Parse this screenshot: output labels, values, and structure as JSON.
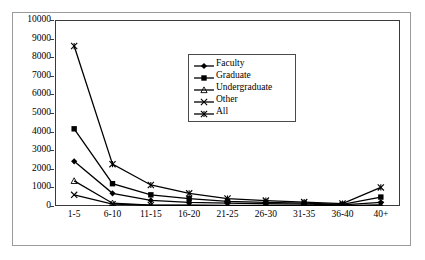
{
  "chart_data": {
    "type": "line",
    "title": "",
    "subtitle": "",
    "xlabel": "",
    "ylabel": "",
    "categories": [
      "1-5",
      "6-10",
      "11-15",
      "16-20",
      "21-25",
      "26-30",
      "31-35",
      "36-40",
      "40+"
    ],
    "ylim": [
      0,
      10000
    ],
    "yticks": [
      0,
      1000,
      2000,
      3000,
      4000,
      5000,
      6000,
      7000,
      8000,
      9000,
      10000
    ],
    "ytick_labels": [
      "0",
      "1000",
      "2000",
      "3000",
      "4000",
      "5000",
      "6000",
      "7000",
      "8000",
      "9000",
      "10000"
    ],
    "grid": false,
    "legend_position": "upper-center-right",
    "series": [
      {
        "name": "Faculty",
        "marker": "diamond",
        "color": "#000000",
        "values": [
          2400,
          680,
          300,
          200,
          150,
          120,
          100,
          60,
          200
        ]
      },
      {
        "name": "Graduate",
        "marker": "square",
        "color": "#000000",
        "values": [
          4150,
          1200,
          600,
          400,
          250,
          200,
          150,
          90,
          480
        ]
      },
      {
        "name": "Undergraduate",
        "marker": "triangle",
        "color": "#000000",
        "values": [
          1350,
          150,
          40,
          30,
          20,
          15,
          10,
          10,
          30
        ]
      },
      {
        "name": "Other",
        "marker": "cross",
        "color": "#000000",
        "values": [
          600,
          100,
          50,
          40,
          30,
          25,
          20,
          15,
          60
        ]
      },
      {
        "name": "All",
        "marker": "asterisk",
        "color": "#000000",
        "values": [
          8600,
          2250,
          1130,
          680,
          400,
          290,
          210,
          130,
          1000
        ]
      }
    ]
  },
  "legend": {
    "items": [
      {
        "label": "Faculty"
      },
      {
        "label": "Graduate"
      },
      {
        "label": "Undergraduate"
      },
      {
        "label": "Other"
      },
      {
        "label": "All"
      }
    ]
  },
  "style": {
    "line_color": "#000000",
    "axis_color": "#3a3a3a",
    "frame_color": "#9a9a9a",
    "background": "#ffffff"
  }
}
